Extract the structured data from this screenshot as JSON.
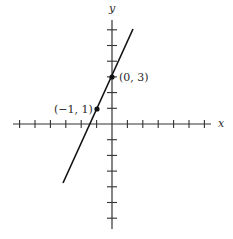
{
  "chart_data": {
    "type": "line",
    "title": "",
    "xlabel": "x",
    "ylabel": "y",
    "equation": "y = 2x + 3",
    "xlim": [
      -6.4,
      6.4
    ],
    "ylim": [
      -6.6,
      6.6
    ],
    "x_ticks": [
      -6,
      -5,
      -4,
      -3,
      -2,
      -1,
      1,
      2,
      3,
      4,
      5,
      6
    ],
    "y_ticks": [
      -6,
      -5,
      -4,
      -3,
      -2,
      -1,
      1,
      2,
      3,
      4,
      5,
      6
    ],
    "tick_labels_shown": false,
    "grid": false,
    "legend": null,
    "series": [
      {
        "name": "line",
        "x": [
          -3.3,
          1.4
        ],
        "y": [
          -3.6,
          5.8
        ],
        "color": "#111111"
      }
    ],
    "points": [
      {
        "x": 0,
        "y": 3,
        "label": "(0, 3)"
      },
      {
        "x": -1,
        "y": 1,
        "label": "(−1, 1)"
      }
    ]
  },
  "labels": {
    "x_axis": "x",
    "y_axis": "y",
    "point_a": "(0, 3)",
    "point_b": "(−1, 1)"
  },
  "colors": {
    "axis": "#333333",
    "line": "#111111",
    "text": "#2a2a2a",
    "background": "#ffffff"
  }
}
